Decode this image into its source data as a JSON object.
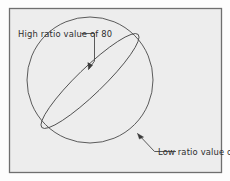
{
  "figure": {
    "type": "diagram",
    "background_color": "#ededed",
    "frame_color": "#6f6f6f",
    "line_color": "#4a4a4a",
    "text_color": "#2e2e2e",
    "annotations": [
      {
        "id": "high-ratio",
        "lines": [
          "High",
          "ratio",
          "value of",
          "80"
        ],
        "text": "High ratio value of 80",
        "value": 80,
        "position": "upper-left",
        "leader": "elbow-with-arrow",
        "points_to": "ellipse-edge"
      },
      {
        "id": "low-ratio",
        "lines": [
          "Low ratio",
          "value of 0"
        ],
        "text": "Low ratio value of 0",
        "value": 0,
        "position": "lower-right",
        "leader": "elbow-with-arrow",
        "points_to": "sphere-outline"
      }
    ],
    "shapes": {
      "circle": {
        "name": "sphere-outline",
        "cx": 90,
        "cy": 80,
        "r": 63
      },
      "ellipse": {
        "name": "tilted-ellipse",
        "cx": 90,
        "cy": 81,
        "rx": 67,
        "ry": 13,
        "rotation_deg": -44
      }
    }
  }
}
